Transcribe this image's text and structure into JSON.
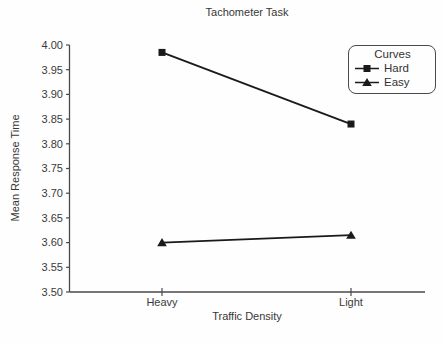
{
  "chart_data": {
    "type": "line",
    "title": "Tachometer Task",
    "xlabel": "Traffic Density",
    "ylabel": "Mean Response Time",
    "categories": [
      "Heavy",
      "Light"
    ],
    "series": [
      {
        "name": "Hard",
        "marker": "square",
        "values": [
          3.985,
          3.84
        ]
      },
      {
        "name": "Easy",
        "marker": "triangle",
        "values": [
          3.6,
          3.615
        ]
      }
    ],
    "ylim": [
      3.5,
      4.0
    ],
    "ytick_step": 0.05,
    "ytick_labels": [
      "3.50",
      "3.55",
      "3.60",
      "3.65",
      "3.70",
      "3.75",
      "3.80",
      "3.85",
      "3.90",
      "3.95",
      "4.00"
    ],
    "grid": false,
    "legend_title": "Curves",
    "legend_position": "top-right",
    "line_color": "#1a1a1a",
    "axis_color": "#4a4a4a",
    "text_color": "#3a3a3a",
    "background": "#fefefe"
  }
}
